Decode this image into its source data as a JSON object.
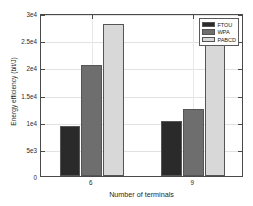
{
  "chart_data": {
    "type": "bar",
    "title": "",
    "xlabel": "Number of terminals",
    "ylabel": "Energy efficiency (bit/J)",
    "categories": [
      "6",
      "9"
    ],
    "series": [
      {
        "name": "FTOU",
        "values": [
          9200,
          10100
        ],
        "color": "#2a2a2a"
      },
      {
        "name": "WPA",
        "values": [
          20400,
          12400
        ],
        "color": "#6e6e6e"
      },
      {
        "name": "PABCD",
        "values": [
          28000,
          27200
        ],
        "color": "#d8d8d8"
      }
    ],
    "ylim": [
      0,
      30000
    ],
    "yticks": [
      0,
      5000,
      10000,
      15000,
      20000,
      25000,
      30000
    ],
    "ytick_labels": [
      "0",
      "5e3",
      "1e4",
      "1.5e4",
      "2e4",
      "2.5e4",
      "3e4"
    ],
    "grid": true,
    "legend_position": "top-right",
    "bar_edge_color": "#555555",
    "axis_color": "#4a4a4a",
    "grid_color": "#e2e2e2",
    "background": "#ffffff"
  },
  "legend": {
    "entries": [
      {
        "label": "FTOU"
      },
      {
        "label": "WPA"
      },
      {
        "label": "PABCD"
      }
    ]
  }
}
